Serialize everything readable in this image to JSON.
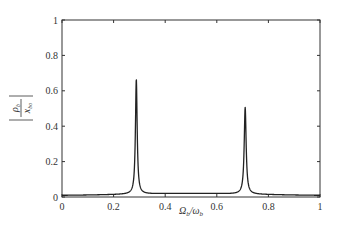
{
  "chart_data": {
    "type": "line",
    "title": "",
    "xlabel": "Ω_b/ω_b",
    "ylabel": "|ρ_b / x_bo|",
    "xlim": [
      0,
      1
    ],
    "ylim": [
      0,
      1
    ],
    "xticks": [
      0,
      0.2,
      0.4,
      0.6,
      0.8,
      1
    ],
    "yticks": [
      0,
      0.2,
      0.4,
      0.6,
      0.8,
      1
    ],
    "xtick_labels": [
      "0",
      "0.2",
      "0.4",
      "0.6",
      "0.8",
      "1"
    ],
    "ytick_labels": [
      "0",
      "0.2",
      "0.4",
      "0.6",
      "0.8",
      "1"
    ],
    "grid": false,
    "legend": null,
    "series": [
      {
        "name": "response",
        "color": "#222222",
        "peaks": [
          {
            "x": 0.288,
            "y": 0.65,
            "width": 0.004
          },
          {
            "x": 0.71,
            "y": 0.49,
            "width": 0.0045
          }
        ],
        "x": [
          0,
          0.05,
          0.1,
          0.15,
          0.2,
          0.24,
          0.26,
          0.27,
          0.28,
          0.285,
          0.288,
          0.291,
          0.296,
          0.305,
          0.32,
          0.35,
          0.4,
          0.45,
          0.5,
          0.55,
          0.6,
          0.65,
          0.68,
          0.695,
          0.703,
          0.71,
          0.717,
          0.725,
          0.74,
          0.77,
          0.8,
          0.85,
          0.9,
          0.95,
          1
        ],
        "values": [
          0.01,
          0.011,
          0.012,
          0.014,
          0.018,
          0.03,
          0.05,
          0.08,
          0.18,
          0.37,
          0.65,
          0.37,
          0.15,
          0.07,
          0.04,
          0.025,
          0.02,
          0.02,
          0.022,
          0.026,
          0.033,
          0.05,
          0.08,
          0.14,
          0.28,
          0.49,
          0.28,
          0.13,
          0.06,
          0.03,
          0.02,
          0.013,
          0.01,
          0.008,
          0.007
        ]
      }
    ]
  }
}
